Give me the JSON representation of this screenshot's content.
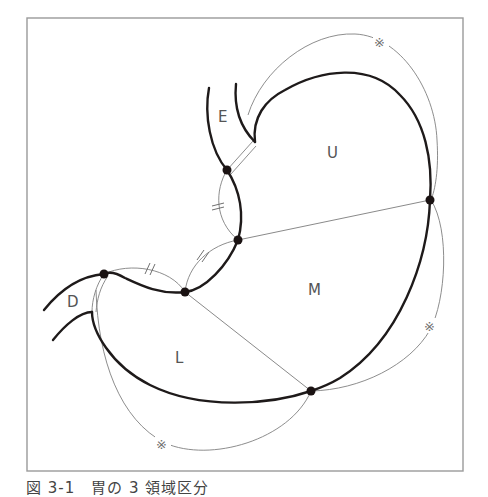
{
  "figure": {
    "caption": "図 3-1　胃の 3 領域区分",
    "regions": [
      {
        "id": "E",
        "label": "E",
        "x": 224,
        "y": 122
      },
      {
        "id": "U",
        "label": "U",
        "x": 333,
        "y": 158
      },
      {
        "id": "M",
        "label": "M",
        "x": 315,
        "y": 295
      },
      {
        "id": "D",
        "label": "D",
        "x": 74,
        "y": 307
      },
      {
        "id": "L",
        "label": "L",
        "x": 180,
        "y": 363
      }
    ],
    "equal_marks": [
      "//",
      "//",
      "//"
    ],
    "reference_mark": "※",
    "reference_marks": [
      {
        "x": 381,
        "y": 46
      },
      {
        "x": 431,
        "y": 330
      },
      {
        "x": 163,
        "y": 448
      }
    ],
    "points": [
      {
        "x": 227,
        "y": 170
      },
      {
        "x": 238,
        "y": 240
      },
      {
        "x": 430,
        "y": 200
      },
      {
        "x": 104,
        "y": 274
      },
      {
        "x": 185,
        "y": 292
      },
      {
        "x": 311,
        "y": 391
      }
    ],
    "colors": {
      "outline": "#1e1a1a",
      "guide": "#808080",
      "frame": "#9a9a9a",
      "label": "#555555"
    }
  }
}
